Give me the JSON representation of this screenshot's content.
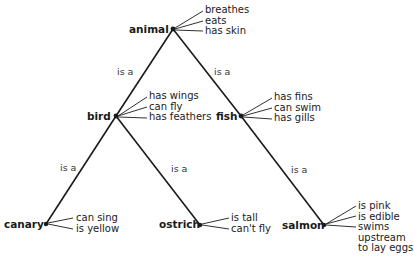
{
  "diagram": {
    "type": "semantic-network",
    "relation_label": "is a",
    "nodes": {
      "animal": {
        "label": "animal",
        "properties": [
          "breathes",
          "eats",
          "has skin"
        ]
      },
      "bird": {
        "label": "bird",
        "properties": [
          "has wings",
          "can fly",
          "has feathers"
        ]
      },
      "fish": {
        "label": "fish",
        "properties": [
          "has fins",
          "can swim",
          "has gills"
        ]
      },
      "canary": {
        "label": "canary",
        "properties": [
          "can sing",
          "is yellow"
        ]
      },
      "ostrich": {
        "label": "ostrich",
        "properties": [
          "is tall",
          "can't fly"
        ]
      },
      "salmon": {
        "label": "salmon",
        "properties": [
          "is pink",
          "is edible",
          "swims",
          "upstream",
          "to lay eggs"
        ]
      }
    },
    "edges": [
      {
        "from": "bird",
        "to": "animal",
        "label": "is a"
      },
      {
        "from": "fish",
        "to": "animal",
        "label": "is a"
      },
      {
        "from": "canary",
        "to": "bird",
        "label": "is a"
      },
      {
        "from": "ostrich",
        "to": "bird",
        "label": "is a"
      },
      {
        "from": "salmon",
        "to": "fish",
        "label": "is a"
      }
    ]
  }
}
